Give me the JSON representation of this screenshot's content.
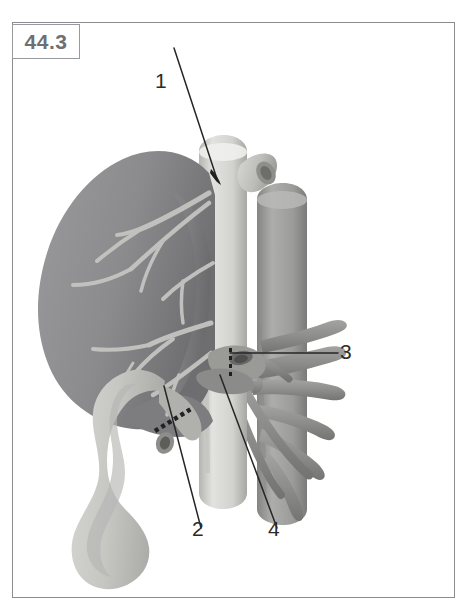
{
  "figure": {
    "number": "44.3",
    "number_box_label": "figure-number",
    "frame_color": "#8c8c90",
    "background_color": "#ffffff"
  },
  "callouts": [
    {
      "id": "1",
      "label": "1",
      "target": "suprahepatic inferior vena cava / hepatic vein confluence",
      "leader_from": [
        172,
        92
      ],
      "leader_to": [
        215,
        175
      ]
    },
    {
      "id": "2",
      "label": "2",
      "target": "bile duct anastomosis with dashed suture line",
      "leader_from": [
        200,
        512
      ],
      "leader_to": [
        162,
        382
      ]
    },
    {
      "id": "3",
      "label": "3",
      "target": "portal vein / vascular cuff at hilum",
      "leader_from": [
        336,
        352
      ],
      "leader_to": [
        228,
        352
      ]
    },
    {
      "id": "4",
      "label": "4",
      "target": "hepatic artery branch from aorta",
      "leader_from": [
        276,
        512
      ],
      "leader_to": [
        218,
        372
      ]
    }
  ],
  "colors": {
    "liver": "#8e8e90",
    "liver_shadow": "#6f6f72",
    "liver_vessels": "#c2c2c0",
    "vena_cava": "#cfcfcc",
    "vena_cava_shade": "#a9a9a6",
    "aorta": "#9d9d9b",
    "aorta_shade": "#7d7d7b",
    "duodenum": "#c9c9c6",
    "duodenum_shade": "#aeaeab",
    "branch_vessel": "#8f8f8d",
    "leader_line": "#262626",
    "label_text": "#2b2b2b",
    "figure_number_text": "#6f6f73"
  },
  "structures": [
    {
      "name": "liver",
      "description": "large shaded liver lobe, upper-left, with lighter intrahepatic vascular tree"
    },
    {
      "name": "inferior-vena-cava",
      "description": "pale vertical tube running down the centre with a cut hepatic vein stump branching to the right at the top"
    },
    {
      "name": "aorta",
      "description": "darker vertical tube to the right of the vena cava"
    },
    {
      "name": "duodenum",
      "description": "C-shaped pale loop descending at lower-left"
    },
    {
      "name": "visceral-branches",
      "description": "series of curved arterial branches radiating right from the aorta"
    },
    {
      "name": "suture-line",
      "description": "short dashed line across the bile duct indicating an anastomosis"
    }
  ]
}
